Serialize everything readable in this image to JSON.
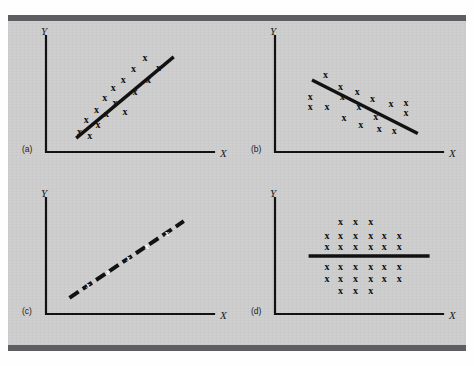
{
  "figure": {
    "background_color": "#cfcfcf",
    "rule_color": "#5d5d62",
    "ink_color": "#121212"
  },
  "chart_data": [
    {
      "type": "scatter",
      "panel": "a",
      "panel_label": "(a)",
      "title": "",
      "xlabel": "X",
      "ylabel": "Y",
      "grid": false,
      "legend": "none",
      "xlim": [
        0,
        100
      ],
      "ylim": [
        0,
        100
      ],
      "description": "Strong positive correlation: points scatter closely about an upward-sloping trend line",
      "trend_line": {
        "style": "solid",
        "x1": 18,
        "y1": 12,
        "x2": 76,
        "y2": 82
      },
      "points": [
        {
          "x": 20,
          "y": 18
        },
        {
          "x": 26,
          "y": 14
        },
        {
          "x": 24,
          "y": 28
        },
        {
          "x": 31,
          "y": 24
        },
        {
          "x": 30,
          "y": 37
        },
        {
          "x": 36,
          "y": 33
        },
        {
          "x": 35,
          "y": 47
        },
        {
          "x": 41,
          "y": 43
        },
        {
          "x": 40,
          "y": 56
        },
        {
          "x": 47,
          "y": 35
        },
        {
          "x": 46,
          "y": 63
        },
        {
          "x": 53,
          "y": 52
        },
        {
          "x": 52,
          "y": 72
        },
        {
          "x": 59,
          "y": 82
        },
        {
          "x": 61,
          "y": 63
        },
        {
          "x": 67,
          "y": 73
        }
      ]
    },
    {
      "type": "scatter",
      "panel": "b",
      "panel_label": "(b)",
      "title": "",
      "xlabel": "X",
      "ylabel": "Y",
      "grid": false,
      "legend": "none",
      "xlim": [
        0,
        100
      ],
      "ylim": [
        0,
        100
      ],
      "description": "Negative correlation: points scatter about a downward-sloping trend line",
      "trend_line": {
        "style": "solid",
        "x1": 22,
        "y1": 62,
        "x2": 85,
        "y2": 16
      },
      "points": [
        {
          "x": 21,
          "y": 48
        },
        {
          "x": 21,
          "y": 39
        },
        {
          "x": 30,
          "y": 67
        },
        {
          "x": 31,
          "y": 39
        },
        {
          "x": 39,
          "y": 57
        },
        {
          "x": 40,
          "y": 48
        },
        {
          "x": 41,
          "y": 30
        },
        {
          "x": 49,
          "y": 52
        },
        {
          "x": 50,
          "y": 39
        },
        {
          "x": 51,
          "y": 24
        },
        {
          "x": 58,
          "y": 46
        },
        {
          "x": 60,
          "y": 31
        },
        {
          "x": 62,
          "y": 20
        },
        {
          "x": 69,
          "y": 42
        },
        {
          "x": 71,
          "y": 19
        },
        {
          "x": 78,
          "y": 43
        },
        {
          "x": 78,
          "y": 34
        }
      ]
    },
    {
      "type": "scatter",
      "panel": "c",
      "panel_label": "(c)",
      "title": "",
      "xlabel": "X",
      "ylabel": "Y",
      "grid": false,
      "legend": "none",
      "xlim": [
        0,
        100
      ],
      "ylim": [
        0,
        100
      ],
      "description": "Perfect positive correlation: every point lies exactly on the upward-sloping line",
      "trend_line": {
        "style": "dashed",
        "x1": 14,
        "y1": 14,
        "x2": 82,
        "y2": 80
      },
      "points": [
        {
          "x": 25,
          "y": 25
        },
        {
          "x": 37,
          "y": 36
        },
        {
          "x": 49,
          "y": 48
        },
        {
          "x": 60,
          "y": 59
        },
        {
          "x": 72,
          "y": 70
        }
      ]
    },
    {
      "type": "scatter",
      "panel": "d",
      "panel_label": "(d)",
      "title": "",
      "xlabel": "X",
      "ylabel": "Y",
      "grid": false,
      "legend": "none",
      "xlim": [
        0,
        100
      ],
      "ylim": [
        0,
        100
      ],
      "description": "No correlation: a symmetric cloud of points about a flat horizontal line",
      "trend_line": {
        "style": "solid",
        "x1": 20,
        "y1": 50,
        "x2": 92,
        "y2": 50
      },
      "points": [
        {
          "x": 39,
          "y": 80
        },
        {
          "x": 48,
          "y": 80
        },
        {
          "x": 57,
          "y": 80
        },
        {
          "x": 31,
          "y": 68
        },
        {
          "x": 39,
          "y": 68
        },
        {
          "x": 48,
          "y": 68
        },
        {
          "x": 57,
          "y": 68
        },
        {
          "x": 65,
          "y": 68
        },
        {
          "x": 74,
          "y": 68
        },
        {
          "x": 31,
          "y": 58
        },
        {
          "x": 39,
          "y": 58
        },
        {
          "x": 48,
          "y": 58
        },
        {
          "x": 57,
          "y": 58
        },
        {
          "x": 65,
          "y": 58
        },
        {
          "x": 74,
          "y": 58
        },
        {
          "x": 31,
          "y": 41
        },
        {
          "x": 39,
          "y": 41
        },
        {
          "x": 48,
          "y": 41
        },
        {
          "x": 57,
          "y": 41
        },
        {
          "x": 65,
          "y": 41
        },
        {
          "x": 74,
          "y": 41
        },
        {
          "x": 31,
          "y": 31
        },
        {
          "x": 39,
          "y": 31
        },
        {
          "x": 48,
          "y": 31
        },
        {
          "x": 57,
          "y": 31
        },
        {
          "x": 65,
          "y": 31
        },
        {
          "x": 74,
          "y": 31
        },
        {
          "x": 39,
          "y": 20
        },
        {
          "x": 48,
          "y": 20
        },
        {
          "x": 57,
          "y": 20
        }
      ]
    }
  ],
  "marks": {
    "point_glyph": "x"
  },
  "axes": {
    "x_label": "X",
    "y_label": "Y"
  },
  "panel_labels": {
    "a": "(a)",
    "b": "(b)",
    "c": "(c)",
    "d": "(d)"
  }
}
